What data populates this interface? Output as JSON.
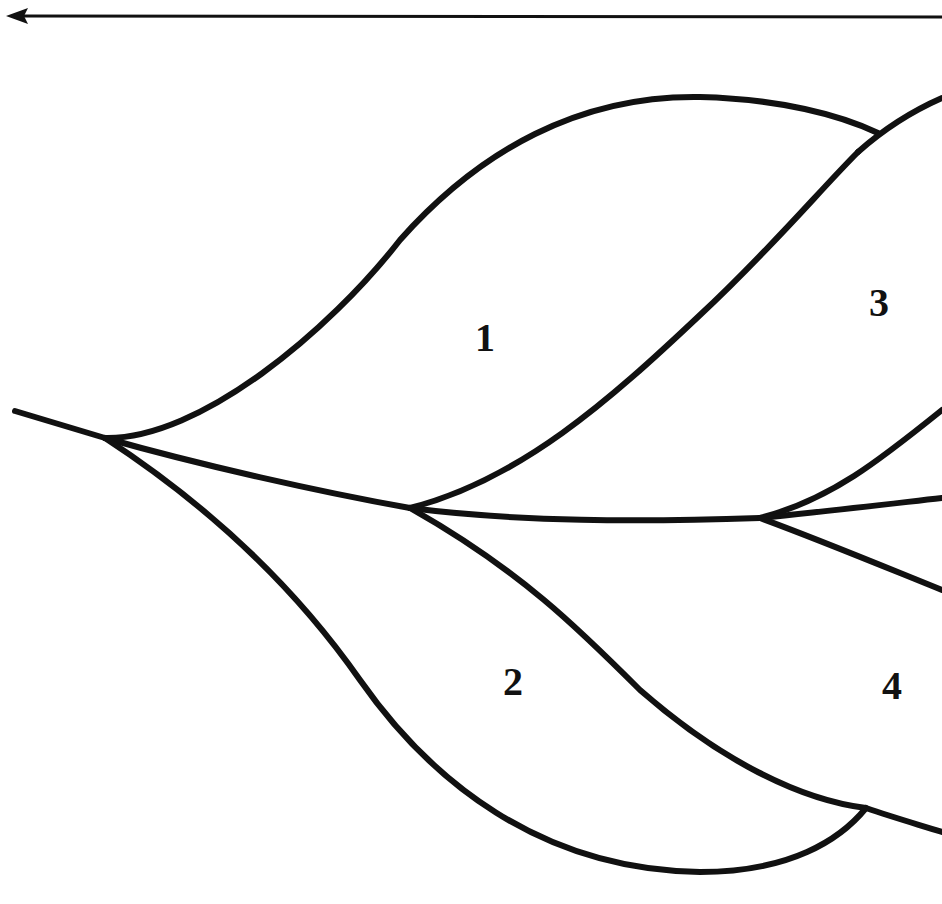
{
  "diagram": {
    "type": "branching-tree",
    "stroke_color": "#111111",
    "background": "#ffffff",
    "arrow": {
      "direction": "left"
    },
    "labels": [
      {
        "id": "1",
        "text": "1",
        "x": 475,
        "y": 318
      },
      {
        "id": "2",
        "text": "2",
        "x": 503,
        "y": 662
      },
      {
        "id": "3",
        "text": "3",
        "x": 869,
        "y": 283
      },
      {
        "id": "4",
        "text": "4",
        "x": 882,
        "y": 666
      }
    ],
    "nodes": [
      {
        "id": "root",
        "x": 105,
        "y": 438
      },
      {
        "id": "n1",
        "x": 410,
        "y": 508
      },
      {
        "id": "n2",
        "x": 760,
        "y": 518
      }
    ]
  }
}
